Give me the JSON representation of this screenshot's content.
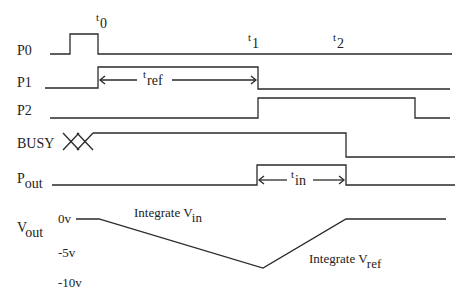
{
  "diagram": {
    "type": "timing-diagram",
    "signals": [
      {
        "name": "P0",
        "label_main": "P0",
        "label_sub": ""
      },
      {
        "name": "P1",
        "label_main": "P1",
        "label_sub": ""
      },
      {
        "name": "P2",
        "label_main": "P2",
        "label_sub": ""
      },
      {
        "name": "BUSY",
        "label_main": "BUSY",
        "label_sub": ""
      },
      {
        "name": "Pout",
        "label_main": "P",
        "label_sub": "out"
      },
      {
        "name": "Vout",
        "label_main": "V",
        "label_sub": "out"
      }
    ],
    "time_markers": [
      {
        "main": "t",
        "sub": "0"
      },
      {
        "main": "t",
        "sub": "1"
      },
      {
        "main": "t",
        "sub": "2"
      }
    ],
    "intervals": {
      "t_ref": {
        "main": "t",
        "sub": "ref"
      },
      "t_in": {
        "main": "t",
        "sub": "in"
      }
    },
    "vout_axis": [
      "0v",
      "-5v",
      "-10v"
    ],
    "annotations": {
      "integrate_vin": {
        "main": "Integrate V",
        "sub": "in"
      },
      "integrate_vref": {
        "main": "Integrate V",
        "sub": "ref"
      }
    },
    "line_color": "#2a2a2a"
  }
}
